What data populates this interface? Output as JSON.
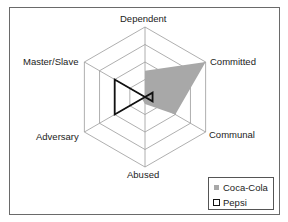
{
  "chart_data": {
    "type": "radar",
    "title": "",
    "axes": [
      "Dependent",
      "Committed",
      "Communal",
      "Abused",
      "Adversary",
      "Master/Slave"
    ],
    "range": [
      0,
      4
    ],
    "rings": 4,
    "grid": true,
    "legend_position": "bottom-right",
    "series": [
      {
        "name": "Coca-Cola",
        "style": "filled",
        "color": "#a8a8a8",
        "values": [
          1.5,
          4,
          2,
          0.4,
          0.2,
          0
        ]
      },
      {
        "name": "Pepsi",
        "style": "outline",
        "color": "#111111",
        "values": [
          0,
          0.5,
          0.5,
          0,
          2,
          2
        ]
      }
    ]
  },
  "labels": {
    "dependent": "Dependent",
    "committed": "Committed",
    "communal": "Communal",
    "abused": "Abused",
    "adversary": "Adversary",
    "master_slave": "Master/Slave"
  },
  "legend": {
    "items": [
      {
        "label": "Coca-Cola"
      },
      {
        "label": "Pepsi"
      }
    ]
  }
}
